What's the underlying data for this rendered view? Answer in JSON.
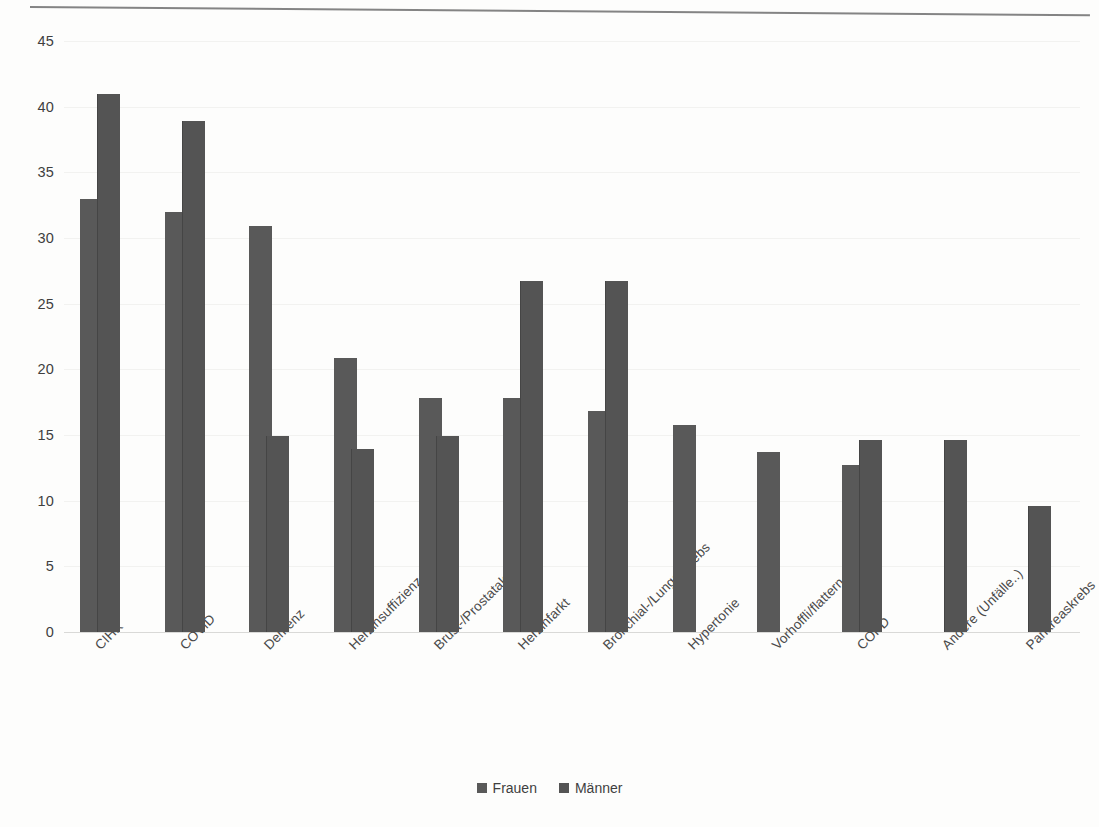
{
  "chart_data": {
    "type": "bar",
    "title": "",
    "subtitle": "",
    "xlabel": "",
    "ylabel": "",
    "ylim": [
      0,
      45
    ],
    "ytick_step": 5,
    "yticks": [
      "45",
      "40",
      "35",
      "30",
      "25",
      "20",
      "15",
      "10",
      "5",
      "0"
    ],
    "grid": true,
    "legend_position": "bottom",
    "categories": [
      "CIHK",
      "COVID",
      "Demenz",
      "Herzinsuffizienz",
      "Brust-/Prostatakrebs",
      "Herzinfarkt",
      "Bronchial-/Lungenkrebs",
      "Hypertonie",
      "Vorhoffli/flattern",
      "COPD",
      "Andere (Unfälle..)",
      "Pankreaskrebs"
    ],
    "series": [
      {
        "name": "Frauen",
        "color": "#595959",
        "values": [
          33.0,
          32.0,
          30.9,
          20.9,
          17.8,
          17.8,
          16.8,
          15.8,
          13.7,
          12.7,
          null,
          null
        ]
      },
      {
        "name": "Männer",
        "color": "#545454",
        "values": [
          41.0,
          38.9,
          14.9,
          13.9,
          14.9,
          26.7,
          26.7,
          null,
          null,
          14.6,
          14.6,
          9.6
        ]
      }
    ]
  },
  "legend": {
    "items": [
      {
        "label": "Frauen"
      },
      {
        "label": "Männer"
      }
    ]
  },
  "colors": {
    "bar_frauen": "#595959",
    "bar_maenner": "#545454",
    "gridline": "#f2f2f0",
    "axis": "#d9d9d7",
    "text": "#3f3f3f"
  }
}
